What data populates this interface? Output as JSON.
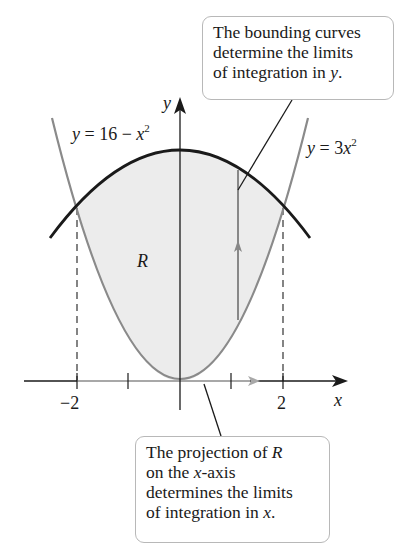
{
  "callouts": {
    "top": {
      "lines": [
        "The bounding curves",
        "determine the limits",
        "of integration in "
      ],
      "var": "y",
      "end": "."
    },
    "bottom": {
      "line1_pre": "The projection of ",
      "line1_var": "R",
      "line2_pre": "on the ",
      "line2_var": "x",
      "line2_post": "-axis",
      "line3": "determines the limits",
      "line4_pre": "of integration in ",
      "line4_var": "x",
      "line4_post": "."
    }
  },
  "curves": {
    "upper": {
      "lhs": "y",
      "eq": " = 16 − ",
      "var": "x",
      "exp": "2"
    },
    "lower": {
      "lhs": "y",
      "eq": " = 3",
      "var": "x",
      "exp": "2"
    }
  },
  "axes": {
    "x_label": "x",
    "y_label": "y",
    "ticks": [
      "−2",
      "2"
    ]
  },
  "region_label": "R",
  "colors": {
    "upper_curve": "#1a1a1a",
    "lower_curve": "#8a8a8a",
    "region_fill": "#ececec",
    "axis": "#1a1a1a",
    "projection_arrow": "#a0a0a0"
  }
}
